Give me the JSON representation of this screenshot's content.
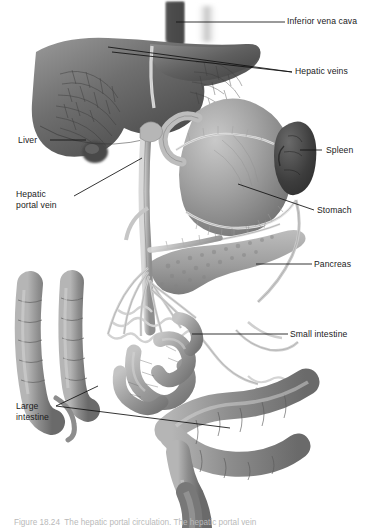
{
  "figure": {
    "style": "grayscale medical illustration",
    "ink_color": "#1a1a1a",
    "background": "#ffffff",
    "caption": "Figure 18.24  The hepatic portal circulation. The hepatic portal vein"
  },
  "labels": [
    {
      "id": "inferior-vena-cava",
      "text": "Inferior vena cava",
      "side": "right",
      "x": 287,
      "y": 16
    },
    {
      "id": "hepatic-veins",
      "text": "Hepatic veins",
      "side": "right",
      "x": 295,
      "y": 66
    },
    {
      "id": "liver",
      "text": "Liver",
      "side": "left",
      "x": 18,
      "y": 135
    },
    {
      "id": "spleen",
      "text": "Spleen",
      "side": "right",
      "x": 326,
      "y": 145
    },
    {
      "id": "hepatic-portal-vein",
      "text": "Hepatic\nportal vein",
      "side": "left",
      "x": 16,
      "y": 189
    },
    {
      "id": "stomach",
      "text": "Stomach",
      "side": "right",
      "x": 317,
      "y": 205
    },
    {
      "id": "pancreas",
      "text": "Pancreas",
      "side": "right",
      "x": 314,
      "y": 259
    },
    {
      "id": "small-intestine",
      "text": "Small intestine",
      "side": "right",
      "x": 290,
      "y": 329
    },
    {
      "id": "large-intestine",
      "text": "Large\nintestine",
      "side": "left",
      "x": 16,
      "y": 401
    }
  ],
  "structures": [
    {
      "id": "liver",
      "name": "Liver"
    },
    {
      "id": "stomach",
      "name": "Stomach"
    },
    {
      "id": "spleen",
      "name": "Spleen"
    },
    {
      "id": "pancreas",
      "name": "Pancreas"
    },
    {
      "id": "small-intestine",
      "name": "Small intestine"
    },
    {
      "id": "large-intestine",
      "name": "Large intestine"
    },
    {
      "id": "inferior-vena-cava",
      "name": "Inferior vena cava"
    },
    {
      "id": "hepatic-veins",
      "name": "Hepatic veins"
    },
    {
      "id": "hepatic-portal-vein",
      "name": "Hepatic portal vein"
    }
  ]
}
